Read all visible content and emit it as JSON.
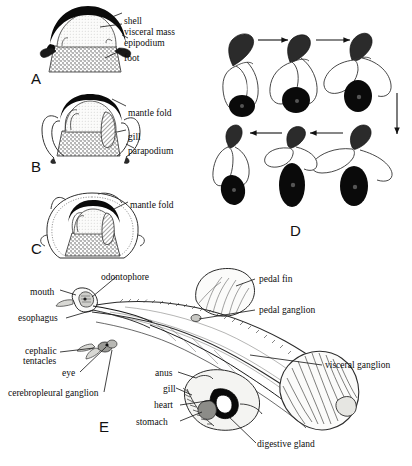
{
  "figure": {
    "title_letters": [
      {
        "id": "A",
        "text": "A",
        "x": 31,
        "y": 70
      },
      {
        "id": "B",
        "text": "B",
        "x": 31,
        "y": 158
      },
      {
        "id": "C",
        "text": "C",
        "x": 31,
        "y": 240
      },
      {
        "id": "D",
        "text": "D",
        "x": 290,
        "y": 227
      },
      {
        "id": "E",
        "text": "E",
        "x": 99,
        "y": 424
      }
    ],
    "panels": {
      "A": {
        "letter": "A",
        "description": "transverse section with external shell covering visceral mass",
        "labels": [
          {
            "name": "shell",
            "text": "shell",
            "x": 124,
            "y": 16
          },
          {
            "name": "visceral-mass",
            "text": "visceral  mass",
            "x": 124,
            "y": 27
          },
          {
            "name": "epipodium",
            "text": "epipodium",
            "x": 124,
            "y": 38
          },
          {
            "name": "foot",
            "text": "foot",
            "x": 124,
            "y": 53
          }
        ]
      },
      "B": {
        "letter": "B",
        "description": "transverse section with mantle fold partly enclosing shell, gill and parapodium",
        "labels": [
          {
            "name": "mantle-fold",
            "text": "mantle  fold",
            "x": 128,
            "y": 108
          },
          {
            "name": "gill",
            "text": "gill",
            "x": 128,
            "y": 132
          },
          {
            "name": "parapodium",
            "text": "parapodium",
            "x": 128,
            "y": 146
          }
        ]
      },
      "C": {
        "letter": "C",
        "description": "transverse section with mantle fold fully enclosing internal shell",
        "labels": [
          {
            "name": "mantle-fold",
            "text": "mantle  fold",
            "x": 130,
            "y": 200
          }
        ]
      },
      "D": {
        "letter": "D",
        "description": "six-stage sequence of swimming movements, arrows indicating cycle direction"
      },
      "E": {
        "letter": "E",
        "description": "lateral view of internal anatomy",
        "labels": [
          {
            "name": "odontophore",
            "text": "odontophore",
            "x": 101,
            "y": 272
          },
          {
            "name": "mouth",
            "text": "mouth",
            "x": 30,
            "y": 292
          },
          {
            "name": "esophagus",
            "text": "esophagus",
            "x": 18,
            "y": 320
          },
          {
            "name": "cephalic",
            "text": "cephalic",
            "x": 23,
            "y": 349
          },
          {
            "name": "tentacles",
            "text": "tentacles",
            "x": 23,
            "y": 359
          },
          {
            "name": "eye",
            "text": "eye",
            "x": 70,
            "y": 375
          },
          {
            "name": "cerebropleural-ganglion",
            "text": "cerebropleural  ganglion",
            "x": 10,
            "y": 397
          },
          {
            "name": "pedal-fin",
            "text": "pedal  fin",
            "x": 257,
            "y": 278
          },
          {
            "name": "pedal-ganglion",
            "text": "pedal  ganglion",
            "x": 257,
            "y": 310
          },
          {
            "name": "visceral-ganglion",
            "text": "visceral  ganglion",
            "x": 324,
            "y": 364
          },
          {
            "name": "anus",
            "text": "anus",
            "x": 155,
            "y": 374
          },
          {
            "name": "gill",
            "text": "gill",
            "x": 163,
            "y": 390
          },
          {
            "name": "heart",
            "text": "heart",
            "x": 156,
            "y": 407
          },
          {
            "name": "stomach",
            "text": "stomach",
            "x": 137,
            "y": 424
          },
          {
            "name": "digestive-gland",
            "text": "digestive  gland",
            "x": 257,
            "y": 446
          }
        ]
      }
    },
    "colors": {
      "ink": "#111111",
      "shell_black": "#0a0a0a",
      "visceral_fill": "#f2f2f0",
      "foot_stipple": "#9a9a96",
      "background": "#ffffff"
    }
  }
}
